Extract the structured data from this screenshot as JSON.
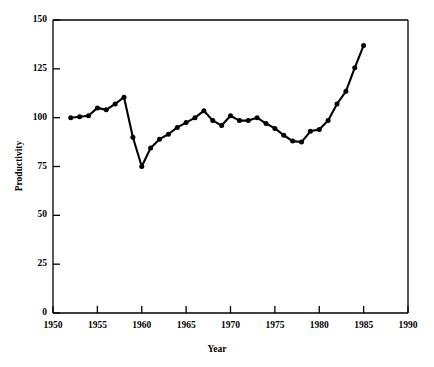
{
  "chart_data": {
    "type": "line",
    "title": "",
    "xlabel": "Year",
    "ylabel": "Productivity",
    "xlim": [
      1950,
      1990
    ],
    "ylim": [
      0,
      150
    ],
    "xticks": [
      1950,
      1955,
      1960,
      1965,
      1970,
      1975,
      1980,
      1985,
      1990
    ],
    "yticks": [
      0,
      25,
      50,
      75,
      100,
      125,
      150
    ],
    "xtick_labels": [
      "1950",
      "1955",
      "1960",
      "1965",
      "1970",
      "1975",
      "1980",
      "1985",
      "1990"
    ],
    "ytick_labels": [
      "0",
      "25",
      "50",
      "75",
      "100",
      "125",
      "150"
    ],
    "grid": false,
    "legend": null,
    "marker": "filled-circle",
    "line_color": "#000000",
    "marker_color": "#000000",
    "x": [
      1952,
      1953,
      1954,
      1955,
      1956,
      1957,
      1958,
      1959,
      1960,
      1961,
      1962,
      1963,
      1964,
      1965,
      1966,
      1967,
      1968,
      1969,
      1970,
      1971,
      1972,
      1973,
      1974,
      1975,
      1976,
      1977,
      1978,
      1979,
      1980,
      1981,
      1982,
      1983,
      1984,
      1985
    ],
    "values": [
      100,
      100.5,
      101,
      105,
      104,
      107,
      110.5,
      90,
      75,
      84.5,
      89,
      91.5,
      95,
      97.5,
      100,
      103.5,
      98.5,
      96,
      101,
      98.5,
      98.5,
      100,
      97,
      94.5,
      91,
      88,
      87.5,
      93,
      94,
      98.5,
      107,
      113.5,
      125.5,
      137
    ],
    "series": [
      {
        "name": "Productivity",
        "points": [
          {
            "x": 1952,
            "y": 100
          },
          {
            "x": 1953,
            "y": 100.5
          },
          {
            "x": 1954,
            "y": 101
          },
          {
            "x": 1955,
            "y": 105
          },
          {
            "x": 1956,
            "y": 104
          },
          {
            "x": 1957,
            "y": 107
          },
          {
            "x": 1958,
            "y": 110.5
          },
          {
            "x": 1959,
            "y": 90
          },
          {
            "x": 1960,
            "y": 75
          },
          {
            "x": 1961,
            "y": 84.5
          },
          {
            "x": 1962,
            "y": 89
          },
          {
            "x": 1963,
            "y": 91.5
          },
          {
            "x": 1964,
            "y": 95
          },
          {
            "x": 1965,
            "y": 97.5
          },
          {
            "x": 1966,
            "y": 100
          },
          {
            "x": 1967,
            "y": 103.5
          },
          {
            "x": 1968,
            "y": 98.5
          },
          {
            "x": 1969,
            "y": 96
          },
          {
            "x": 1970,
            "y": 101
          },
          {
            "x": 1971,
            "y": 98.5
          },
          {
            "x": 1972,
            "y": 98.5
          },
          {
            "x": 1973,
            "y": 100
          },
          {
            "x": 1974,
            "y": 97
          },
          {
            "x": 1975,
            "y": 94.5
          },
          {
            "x": 1976,
            "y": 91
          },
          {
            "x": 1977,
            "y": 88
          },
          {
            "x": 1978,
            "y": 87.5
          },
          {
            "x": 1979,
            "y": 93
          },
          {
            "x": 1980,
            "y": 94
          },
          {
            "x": 1981,
            "y": 98.5
          },
          {
            "x": 1982,
            "y": 107
          },
          {
            "x": 1983,
            "y": 113.5
          },
          {
            "x": 1984,
            "y": 125.5
          },
          {
            "x": 1985,
            "y": 137
          }
        ]
      }
    ]
  }
}
